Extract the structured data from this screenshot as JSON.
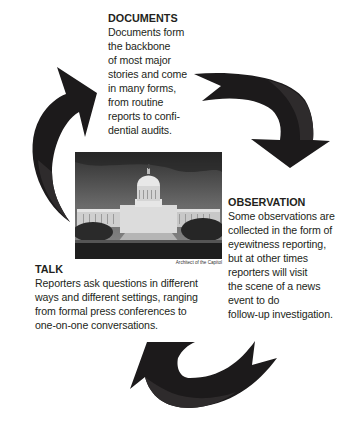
{
  "documents": {
    "heading": "DOCUMENTS",
    "lines": [
      "Documents form",
      "the backbone",
      "of most major",
      "stories and come",
      "in many forms,",
      "from routine",
      "reports to confi-",
      "dential audits."
    ]
  },
  "observation": {
    "heading": "OBSERVATION",
    "lines": [
      "Some observations are",
      "collected in the form of",
      "eyewitness reporting,",
      "but at other times",
      "reporters will visit",
      "the scene of a news",
      "event to do",
      "follow-up investigation."
    ]
  },
  "talk": {
    "heading": "TALK",
    "lines": [
      "Reporters ask questions in different",
      "ways and different settings, ranging",
      "from formal press conferences to",
      "one-on-one conversations."
    ]
  },
  "photo": {
    "subject": "U.S. Capitol building",
    "caption": "Architect of the Capitol"
  },
  "arrows": {
    "color": "#1c1a1b",
    "shade": "#2e2b2c",
    "items": [
      "arrow-talk-to-documents",
      "arrow-documents-to-observation",
      "arrow-observation-to-talk"
    ]
  }
}
